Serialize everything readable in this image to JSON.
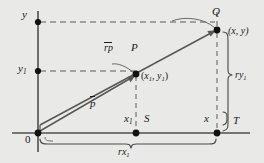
{
  "figure": {
    "kind": "vector-scaling-geometry-diagram",
    "axes": {
      "y_axis_label": "y",
      "y1_axis_label": "y",
      "y1_sub": "1",
      "origin_label": "0"
    },
    "points": {
      "P": {
        "name": "P",
        "coord_open": "(",
        "coord_x": "x",
        "coord_x_sub": "1",
        "coord_comma": ", ",
        "coord_y": "y",
        "coord_y_sub": "1",
        "coord_close": ")"
      },
      "Q": {
        "name": "Q",
        "coord": "(x, y)"
      },
      "S": {
        "name": "S"
      },
      "T": {
        "name": "T"
      }
    },
    "vectors": {
      "p": {
        "label": "p",
        "overbar": true
      },
      "rp": {
        "label": "rp",
        "overbar": true
      }
    },
    "measures": {
      "x1": {
        "base": "x",
        "sub": "1"
      },
      "x": {
        "base": "x",
        "sub": ""
      },
      "rx1": {
        "base": "rx",
        "sub": "1"
      },
      "ry1": {
        "base": "ry",
        "sub": "1"
      }
    },
    "colors": {
      "background": "#e9e9e7",
      "ink": "#1a1a1a",
      "line": "#4a4a4a",
      "dash": "#555555"
    }
  }
}
